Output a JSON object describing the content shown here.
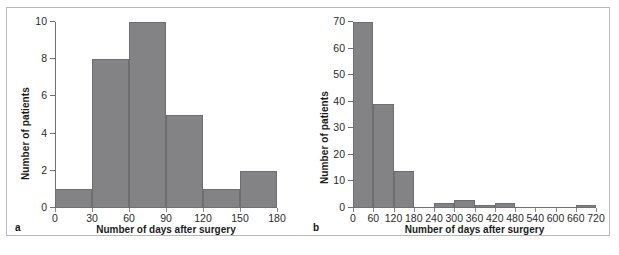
{
  "figure": {
    "background": "#ffffff",
    "frame_color": "#b9b9bb",
    "bar_color": "#838386",
    "bar_edge_color": "#6e6e71",
    "axis_color": "#707074",
    "text_color": "#1b1b1b"
  },
  "panels": [
    {
      "letter": "a",
      "ylabel": "Number of patients",
      "xlabel": "Number of days after surgery",
      "yticks": [
        "0",
        "2",
        "4",
        "6",
        "8",
        "10"
      ],
      "xticks": [
        "0",
        "30",
        "60",
        "90",
        "120",
        "150",
        "180"
      ]
    },
    {
      "letter": "b",
      "ylabel": "Number of patients",
      "xlabel": "Number of days after surgery",
      "yticks": [
        "0",
        "10",
        "20",
        "30",
        "40",
        "50",
        "60",
        "70"
      ],
      "xticks": [
        "0",
        "60",
        "120",
        "180",
        "240",
        "300",
        "360",
        "420",
        "480",
        "540",
        "600",
        "660",
        "720"
      ]
    }
  ],
  "chart_data": [
    {
      "type": "bar",
      "panel": "a",
      "title": "",
      "xlabel": "Number of days after surgery",
      "ylabel": "Number of patients",
      "bin_width": 30,
      "bin_edges": [
        0,
        30,
        60,
        90,
        120,
        150,
        180
      ],
      "categories": [
        "0-30",
        "30-60",
        "60-90",
        "90-120",
        "120-150",
        "150-180"
      ],
      "values": [
        1,
        8,
        10,
        5,
        1,
        2
      ],
      "xlim": [
        0,
        180
      ],
      "ylim": [
        0,
        10
      ],
      "ytick_values": [
        0,
        2,
        4,
        6,
        8,
        10
      ],
      "xtick_values": [
        0,
        30,
        60,
        90,
        120,
        150,
        180
      ],
      "grid": false,
      "legend": null
    },
    {
      "type": "bar",
      "panel": "b",
      "title": "",
      "xlabel": "Number of days after surgery",
      "ylabel": "Number of patients",
      "bin_width": 60,
      "bin_edges": [
        0,
        60,
        120,
        180,
        240,
        300,
        360,
        420,
        480,
        540,
        600,
        660,
        720
      ],
      "categories": [
        "0-60",
        "60-120",
        "120-180",
        "180-240",
        "240-300",
        "300-360",
        "360-420",
        "420-480",
        "480-540",
        "540-600",
        "600-660",
        "660-720"
      ],
      "values": [
        70,
        39,
        14,
        0,
        2,
        3,
        1,
        2,
        0,
        0,
        0,
        1
      ],
      "xlim": [
        0,
        720
      ],
      "ylim": [
        0,
        70
      ],
      "ytick_values": [
        0,
        10,
        20,
        30,
        40,
        50,
        60,
        70
      ],
      "xtick_values": [
        0,
        60,
        120,
        180,
        240,
        300,
        360,
        420,
        480,
        540,
        600,
        660,
        720
      ],
      "grid": false,
      "legend": null
    }
  ]
}
